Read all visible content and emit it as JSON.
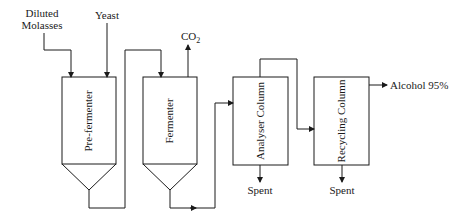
{
  "diagram": {
    "inputs": {
      "molasses": {
        "line1": "Diluted",
        "line2": "Molasses"
      },
      "yeast": "Yeast"
    },
    "vessels": [
      {
        "id": "pre_fermenter",
        "label": "Pre-fermenter"
      },
      {
        "id": "fermenter",
        "label": "Fermenter"
      },
      {
        "id": "analyser_column",
        "label": "Analyser Column"
      },
      {
        "id": "recycling_column",
        "label": "Recycling Column"
      }
    ],
    "outputs": {
      "co2": {
        "base": "CO",
        "sub": "2"
      },
      "spent_analyser": "Spent",
      "spent_recycling": "Spent",
      "alcohol": "Alcohol 95%"
    },
    "colors": {
      "line": "#1a1a1a",
      "background": "#ffffff"
    }
  }
}
